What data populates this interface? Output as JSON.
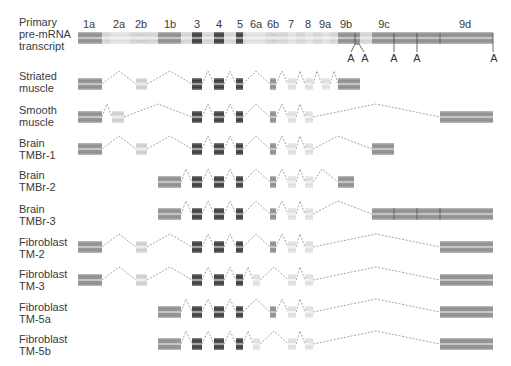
{
  "figure": {
    "primary": {
      "label_lines": [
        "Primary",
        "pre-mRNA",
        "transcript"
      ],
      "exon_labels": [
        {
          "text": "1a",
          "x": 89
        },
        {
          "text": "2a",
          "x": 119
        },
        {
          "text": "2b",
          "x": 141
        },
        {
          "text": "1b",
          "x": 170
        },
        {
          "text": "3",
          "x": 197
        },
        {
          "text": "4",
          "x": 219
        },
        {
          "text": "5",
          "x": 240
        },
        {
          "text": "6a",
          "x": 255
        },
        {
          "text": "6b",
          "x": 273
        },
        {
          "text": "7",
          "x": 291
        },
        {
          "text": "8",
          "x": 308
        },
        {
          "text": "9a",
          "x": 325
        },
        {
          "text": "9b",
          "x": 346
        },
        {
          "text": "9c",
          "x": 383
        },
        {
          "text": "9d",
          "x": 465
        }
      ],
      "polyA_labels": [
        {
          "text": "A",
          "x": 351
        },
        {
          "text": "A",
          "x": 364
        },
        {
          "text": "A",
          "x": 394
        },
        {
          "text": "A",
          "x": 417
        },
        {
          "text": "A",
          "x": 494
        }
      ]
    },
    "isoforms": [
      {
        "label_lines": [
          "Striated",
          "muscle"
        ]
      },
      {
        "label_lines": [
          "Smooth",
          "muscle"
        ]
      },
      {
        "label_lines": [
          "Brain",
          "TMBr-1"
        ]
      },
      {
        "label_lines": [
          "Brain",
          "TMBr-2"
        ]
      },
      {
        "label_lines": [
          "Brain",
          "TMBr-3"
        ]
      },
      {
        "label_lines": [
          "Fibroblast",
          "TM-2"
        ]
      },
      {
        "label_lines": [
          "Fibroblast",
          "TM-3"
        ]
      },
      {
        "label_lines": [
          "Fibroblast",
          "TM-5a"
        ]
      },
      {
        "label_lines": [
          "Fibroblast",
          "TM-5b"
        ]
      }
    ]
  }
}
